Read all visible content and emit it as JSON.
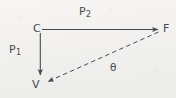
{
  "figure": {
    "type": "vector-diagram",
    "background_color": "#f3f2f0",
    "ink_color": "#4a4a4a",
    "width": 176,
    "height": 98,
    "vertices": [
      {
        "id": "C",
        "label": "C",
        "x": 40,
        "y": 29,
        "label_x": 33,
        "label_y": 24
      },
      {
        "id": "F",
        "label": "F",
        "x": 160,
        "y": 29,
        "label_x": 162,
        "label_y": 24
      },
      {
        "id": "V",
        "label": "V",
        "x": 40,
        "y": 81,
        "label_x": 33,
        "label_y": 80
      }
    ],
    "vectors": [
      {
        "id": "P1",
        "label": "P",
        "subscript": "1",
        "from": "C",
        "to": "V",
        "style": "solid",
        "arrow": "end",
        "label_x": 9,
        "label_y": 45
      },
      {
        "id": "P2",
        "label": "P",
        "subscript": "2",
        "from": "C",
        "to": "F",
        "style": "solid",
        "arrow": "end",
        "label_x": 79,
        "label_y": 7
      }
    ],
    "dashed_segments": [
      {
        "id": "F-to-V",
        "from": "F",
        "to": "V",
        "style": "dashed",
        "arrow": "end"
      }
    ],
    "angles": [
      {
        "id": "theta",
        "label": "θ",
        "at_vertex": "V",
        "between": [
          "F-to-V",
          "P2"
        ],
        "label_x": 110,
        "label_y": 63
      }
    ]
  }
}
